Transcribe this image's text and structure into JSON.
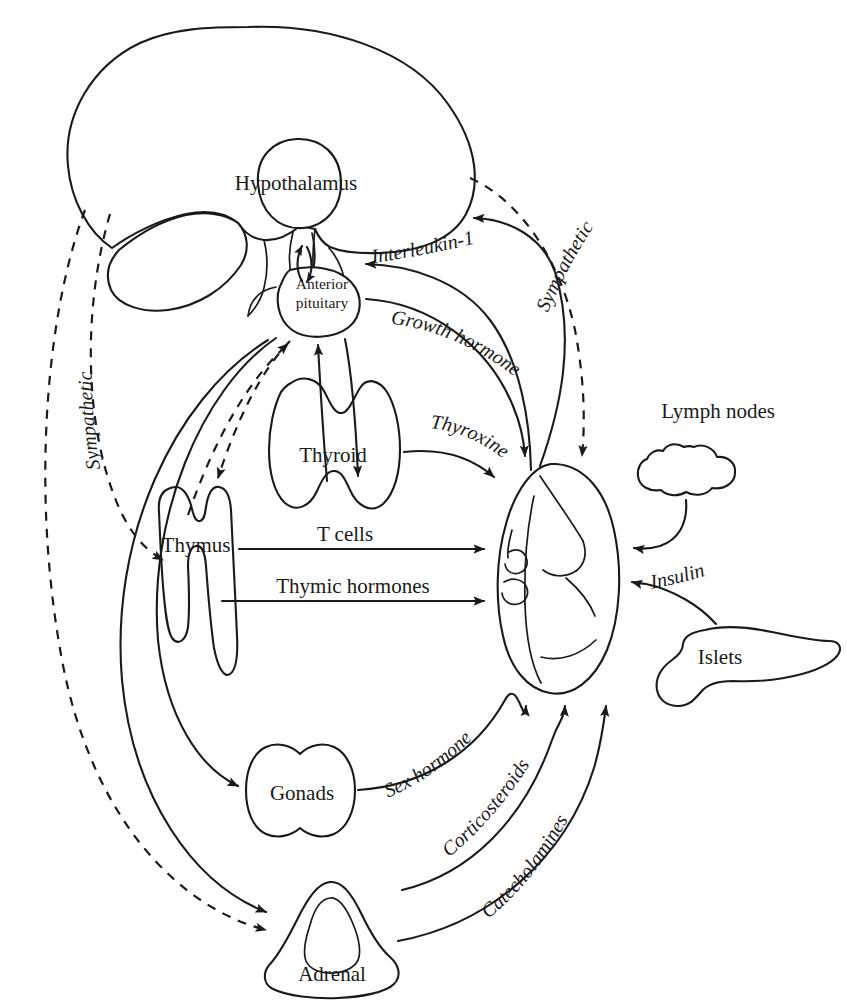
{
  "figure": {
    "domain": "Diagram",
    "type": "neuroendocrine-immune-network",
    "background_color": "#ffffff",
    "line_color": "#1a1a1a"
  },
  "organs": {
    "brain": {
      "label": "",
      "name": "brain-outline"
    },
    "hypothalamus": {
      "label": "Hypothalamus",
      "x": 296,
      "y": 183
    },
    "anterior_pituitary": {
      "label_line1": "Anterior",
      "label_line2": "pituitary",
      "x": 322,
      "y": 290
    },
    "thyroid": {
      "label": "Thyroid",
      "x": 333,
      "y": 455
    },
    "thymus": {
      "label": "Thymus",
      "x": 196,
      "y": 545
    },
    "spleen": {
      "label": "",
      "name": "spleen-outline"
    },
    "lymph_nodes": {
      "label": "Lymph nodes",
      "x": 718,
      "y": 418
    },
    "islets": {
      "label": "Islets",
      "x": 720,
      "y": 657
    },
    "gonads": {
      "label": "Gonads",
      "x": 302,
      "y": 793
    },
    "adrenal": {
      "label": "Adrenal",
      "x": 332,
      "y": 974
    }
  },
  "pathway_labels": {
    "interleukin_1": "Interleukin-1",
    "growth_hormone": "Growth hormone",
    "thyroxine": "Thyroxine",
    "sympathetic_right": "Sympathetic",
    "sympathetic_left": "Sympathetic",
    "t_cells": "T cells",
    "thymic_hormones": "Thymic hormones",
    "insulin": "Insulin",
    "sex_hormone": "Sex hormone",
    "corticosteroids": "Corticosteroids",
    "catecholamines": "Catecholamines"
  },
  "connections": [
    {
      "from": "spleen",
      "to": "hypothalamus",
      "label": "Interleukin-1",
      "style": "solid",
      "direction": "one-way"
    },
    {
      "from": "spleen",
      "to": "anterior-pituitary",
      "label": "Interleukin-1",
      "style": "solid",
      "direction": "one-way"
    },
    {
      "from": "hypothalamus",
      "to": "anterior-pituitary",
      "label": "",
      "style": "solid",
      "direction": "two-way"
    },
    {
      "from": "anterior-pituitary",
      "to": "spleen",
      "label": "Growth hormone",
      "style": "solid",
      "direction": "one-way"
    },
    {
      "from": "anterior-pituitary",
      "to": "thyroid",
      "label": "",
      "style": "solid",
      "direction": "two-way"
    },
    {
      "from": "thyroid",
      "to": "spleen",
      "label": "Thyroxine",
      "style": "solid",
      "direction": "one-way"
    },
    {
      "from": "brain",
      "to": "spleen",
      "label": "Sympathetic",
      "style": "dashed",
      "direction": "one-way"
    },
    {
      "from": "brain",
      "to": "thymus",
      "label": "Sympathetic",
      "style": "dashed",
      "direction": "one-way"
    },
    {
      "from": "brain",
      "to": "anterior-pituitary",
      "label": "Sympathetic",
      "style": "dashed",
      "direction": "one-way"
    },
    {
      "from": "brain",
      "to": "adrenal",
      "label": "Sympathetic",
      "style": "dashed",
      "direction": "one-way"
    },
    {
      "from": "thymus",
      "to": "spleen",
      "label": "T cells",
      "style": "solid",
      "direction": "one-way"
    },
    {
      "from": "thymus",
      "to": "spleen",
      "label": "Thymic hormones",
      "style": "solid",
      "direction": "one-way"
    },
    {
      "from": "lymph-nodes",
      "to": "spleen",
      "label": "",
      "style": "solid",
      "direction": "one-way"
    },
    {
      "from": "islets",
      "to": "spleen",
      "label": "Insulin",
      "style": "solid",
      "direction": "one-way"
    },
    {
      "from": "anterior-pituitary",
      "to": "gonads",
      "label": "",
      "style": "solid",
      "direction": "one-way"
    },
    {
      "from": "anterior-pituitary",
      "to": "adrenal",
      "label": "",
      "style": "solid",
      "direction": "one-way"
    },
    {
      "from": "gonads",
      "to": "spleen",
      "label": "Sex hormone",
      "style": "solid",
      "direction": "one-way"
    },
    {
      "from": "adrenal",
      "to": "spleen",
      "label": "Corticosteroids",
      "style": "solid",
      "direction": "one-way"
    },
    {
      "from": "adrenal",
      "to": "spleen",
      "label": "Catecholamines",
      "style": "solid",
      "direction": "one-way"
    }
  ]
}
